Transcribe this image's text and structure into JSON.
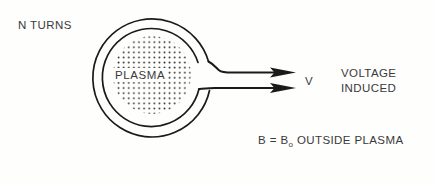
{
  "figure": {
    "background_color": "#fefefd",
    "ink_color": "#1a1a1a",
    "text_color": "#3a3a3a"
  },
  "labels": {
    "n_turns": "N TURNS",
    "plasma": "PLASMA",
    "v": "V",
    "voltage_line1": "VOLTAGE",
    "voltage_line2": "INDUCED",
    "b_field_prefix": "B = B",
    "b_field_subscript": "o",
    "b_field_suffix": " OUTSIDE PLASMA"
  },
  "geometry": {
    "coil_outer_center_x": 156,
    "coil_outer_center_y": 75,
    "coil_outer_radius": 59,
    "coil_inner_radius": 49,
    "plasma_center_x": 152,
    "plasma_center_y": 75,
    "plasma_radius": 39,
    "lead_upper_y": 70,
    "lead_lower_y": 87,
    "lead_arrow_tip_x": 296
  },
  "icons": {
    "arrow_upper": "arrow-right-icon",
    "arrow_lower": "arrow-right-icon",
    "stipple": "plasma-stipple-pattern"
  }
}
